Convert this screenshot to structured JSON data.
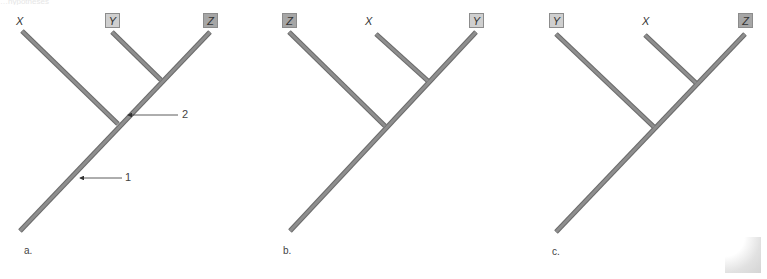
{
  "figure": {
    "top_caption_fragment": "…hypotheses",
    "branch_color": "#8a8a8a",
    "branch_edge_color": "#6a6a6a",
    "box_light_color": "#cfcfcf",
    "box_dark_color": "#a6a6a6",
    "panels": [
      {
        "id": "a",
        "label": "a.",
        "taxa": [
          {
            "name": "X",
            "style": "plain"
          },
          {
            "name": "Y",
            "style": "light-box"
          },
          {
            "name": "Z",
            "style": "dark-box"
          }
        ],
        "topology": "(X,(Y,Z))",
        "callouts": [
          {
            "label": "1",
            "target": "root branch"
          },
          {
            "label": "2",
            "target": "branch leading to (Y,Z)"
          }
        ]
      },
      {
        "id": "b",
        "label": "b.",
        "taxa": [
          {
            "name": "Z",
            "style": "dark-box"
          },
          {
            "name": "X",
            "style": "plain"
          },
          {
            "name": "Y",
            "style": "light-box"
          }
        ],
        "topology": "(Z,(X,Y))",
        "callouts": []
      },
      {
        "id": "c",
        "label": "c.",
        "taxa": [
          {
            "name": "Y",
            "style": "light-box"
          },
          {
            "name": "X",
            "style": "plain"
          },
          {
            "name": "Z",
            "style": "dark-box"
          }
        ],
        "topology": "(Y,(X,Z))",
        "callouts": []
      }
    ]
  }
}
